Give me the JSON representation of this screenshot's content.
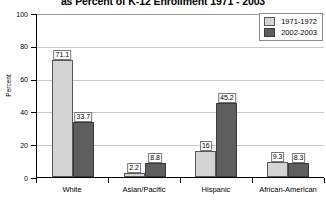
{
  "chart_data": {
    "type": "bar",
    "title": "as Percent of K-12 Enrollment 1971 - 2003",
    "xlabel": "",
    "ylabel": "Percent",
    "ylim": [
      0,
      100
    ],
    "yticks": [
      0,
      20,
      40,
      60,
      80,
      100
    ],
    "grid": true,
    "legend_position": "top-right",
    "categories": [
      "White",
      "Asian/Pacific",
      "Hispanic",
      "African-American"
    ],
    "series": [
      {
        "name": "1971-1972",
        "color": "#d4d4d4",
        "values": [
          71.1,
          2.2,
          16,
          9.3
        ],
        "labels": [
          "71.1",
          "2.2",
          "16",
          "9.3"
        ]
      },
      {
        "name": "2002-2003",
        "color": "#5e5e5e",
        "values": [
          33.7,
          8.8,
          45.2,
          8.3
        ],
        "labels": [
          "33.7",
          "8.8",
          "45.2",
          "8.3"
        ]
      }
    ]
  },
  "axis": {
    "y_tick_labels": [
      "100",
      "80",
      "60",
      "40",
      "20",
      "0"
    ],
    "y_title": "Percent"
  },
  "legend": {
    "items": [
      {
        "label": "1971-1972"
      },
      {
        "label": "2002-2003"
      }
    ]
  }
}
